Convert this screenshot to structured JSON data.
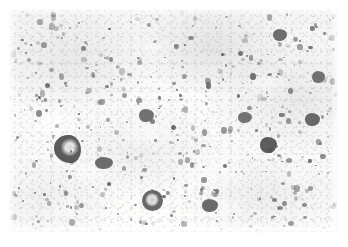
{
  "figure": {
    "kind": "photomicrograph",
    "modality": "brightfield-light-microscopy",
    "stain": "hematoxylin-and-eosin",
    "color_mode": "grayscale",
    "caption": "",
    "title": "",
    "width_px": 348,
    "height_px": 247,
    "margin_px": 9
  },
  "palette": {
    "page_background": "#ffffff",
    "tissue_background": "#f7f7f6",
    "nucleus_dark": "#5a5a5a",
    "nucleus_mid": "#7d7d7d",
    "nucleus_light": "#a3a3a3",
    "large_cell_dark": "#4b4b4b",
    "clearing": "#ffffff"
  },
  "content_region": {
    "left_px": 9,
    "top_px": 9,
    "width_px": 329,
    "height_px": 224
  },
  "clearings": [
    {
      "x": 14,
      "y": 96,
      "w": 58,
      "h": 34,
      "o": 0.7
    },
    {
      "x": 104,
      "y": 104,
      "w": 72,
      "h": 40,
      "o": 0.62
    },
    {
      "x": 160,
      "y": 140,
      "w": 86,
      "h": 46,
      "o": 0.6
    },
    {
      "x": 58,
      "y": 150,
      "w": 44,
      "h": 28,
      "o": 0.55
    },
    {
      "x": 236,
      "y": 60,
      "w": 46,
      "h": 30,
      "o": 0.5
    },
    {
      "x": 262,
      "y": 150,
      "w": 48,
      "h": 32,
      "o": 0.52
    },
    {
      "x": 30,
      "y": 186,
      "w": 52,
      "h": 26,
      "o": 0.5
    },
    {
      "x": 186,
      "y": 186,
      "w": 54,
      "h": 28,
      "o": 0.48
    },
    {
      "x": 120,
      "y": 26,
      "w": 48,
      "h": 24,
      "o": 0.45
    },
    {
      "x": 296,
      "y": 100,
      "w": 34,
      "h": 34,
      "o": 0.42
    }
  ],
  "large_cells": [
    {
      "id": "large-cell-1",
      "x": 45,
      "y": 126,
      "w": 27,
      "h": 28,
      "tone": "#4e4e4e",
      "note": "irregular hyperchromatic blob, left-mid field"
    },
    {
      "id": "large-cell-2",
      "x": 133,
      "y": 181,
      "w": 21,
      "h": 21,
      "tone": "#5c5c5c",
      "note": "round cell with pale central nucleolus, lower-mid field"
    },
    {
      "id": "large-cell-3",
      "x": 251,
      "y": 128,
      "w": 17,
      "h": 16,
      "tone": "#505050",
      "note": "angular dark cell, right-mid field"
    },
    {
      "id": "large-cell-4",
      "x": 86,
      "y": 148,
      "w": 18,
      "h": 12,
      "tone": "#626262",
      "note": "elongated dark cell cluster"
    },
    {
      "id": "large-cell-5",
      "x": 193,
      "y": 190,
      "w": 16,
      "h": 13,
      "tone": "#5f5f5f",
      "note": "dark doublet, bottom-mid field"
    },
    {
      "id": "large-cell-6",
      "x": 130,
      "y": 100,
      "w": 15,
      "h": 13,
      "tone": "#666666",
      "note": "mid-field dark cell"
    },
    {
      "id": "large-cell-7",
      "x": 296,
      "y": 104,
      "w": 15,
      "h": 13,
      "tone": "#5d5d5d",
      "note": "right field dark cell"
    },
    {
      "id": "large-cell-8",
      "x": 229,
      "y": 103,
      "w": 14,
      "h": 11,
      "tone": "#6a6a6a",
      "note": "right-of-centre dark cell"
    },
    {
      "id": "large-cell-9",
      "x": 264,
      "y": 20,
      "w": 14,
      "h": 12,
      "tone": "#636363",
      "note": "upper-right dark cell"
    },
    {
      "id": "large-cell-10",
      "x": 303,
      "y": 62,
      "w": 13,
      "h": 12,
      "tone": "#676767",
      "note": "upper-right dark cell"
    }
  ],
  "nuclei_field": {
    "description": "dense population of small hyperchromatic nuclei",
    "approximate_count": 520,
    "diameter_range_px": [
      1.5,
      6.0
    ],
    "density": "high"
  }
}
